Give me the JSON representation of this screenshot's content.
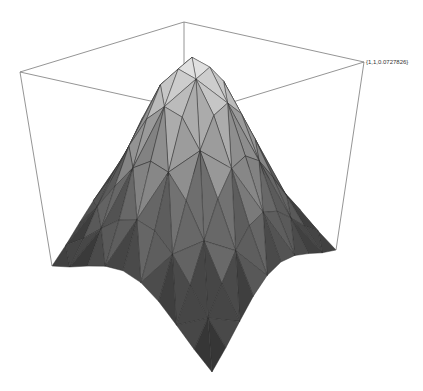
{
  "chart_data": {
    "type": "surface3d",
    "title": "",
    "xlabel": "",
    "ylabel": "",
    "zlabel": "",
    "grid": false,
    "box": true,
    "axes": false,
    "x_range": [
      -1,
      1
    ],
    "y_range": [
      -1,
      1
    ],
    "z_range_approx": [
      0.07,
      1.0
    ],
    "mesh_resolution": 9,
    "corner_annotation": "{1,1,0.0727826}",
    "colors": {
      "surface_light": "#e6e6e6",
      "surface_dark": "#1e1e1e",
      "mesh_line": "#2a2a2a",
      "box_line": "#7a7a7a"
    }
  },
  "labels": {
    "corner": "{1,1,0.0727826}"
  }
}
